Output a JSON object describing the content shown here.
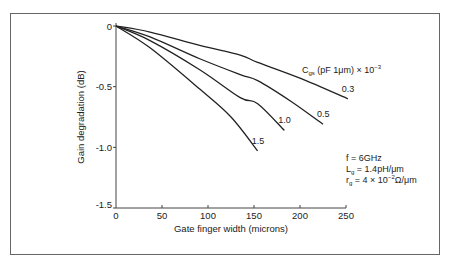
{
  "chart_data": {
    "type": "line",
    "title": "",
    "xlabel": "Gate finger width (microns)",
    "ylabel": "Gain degradation (dB)",
    "xlim": [
      0,
      250
    ],
    "ylim": [
      -1.5,
      0
    ],
    "x_ticks": [
      0,
      50,
      100,
      150,
      200,
      250
    ],
    "x_tick_labels": [
      "0",
      "50",
      "100",
      "150",
      "200",
      "250"
    ],
    "y_ticks": [
      0,
      -0.5,
      -1.0,
      -1.5
    ],
    "y_tick_labels": [
      "0",
      "-0.5",
      "-1.0",
      "-1.5"
    ],
    "grid": false,
    "legend_title": {
      "main": "C",
      "sub": "gs",
      "rest": " (pF 1μm) × 10",
      "sup": "−3"
    },
    "series": [
      {
        "name": "0.3",
        "x": [
          0,
          37,
          91,
          135,
          154,
          200,
          252
        ],
        "y": [
          0,
          -0.05,
          -0.16,
          -0.24,
          -0.3,
          -0.43,
          -0.6
        ]
      },
      {
        "name": "0.5",
        "x": [
          0,
          37,
          91,
          135,
          154,
          190,
          225
        ],
        "y": [
          0,
          -0.09,
          -0.27,
          -0.4,
          -0.45,
          -0.62,
          -0.81
        ]
      },
      {
        "name": "1.0",
        "x": [
          0,
          37,
          91,
          135,
          154,
          183
        ],
        "y": [
          0,
          -0.12,
          -0.36,
          -0.59,
          -0.64,
          -0.86
        ]
      },
      {
        "name": "1.5",
        "x": [
          0,
          37,
          91,
          125,
          154
        ],
        "y": [
          0,
          -0.18,
          -0.52,
          -0.75,
          -1.03
        ]
      }
    ],
    "annotations": [
      {
        "id": "freq",
        "text": "f = 6GHz"
      },
      {
        "id": "inductance",
        "main": "L",
        "sub": "g",
        "rest": " = 1.4pH/μm"
      },
      {
        "id": "resistance",
        "main": "r",
        "sub": "g",
        "rest": " = 4 × 10",
        "sup": "−2",
        "tail": "Ω/μm"
      }
    ]
  }
}
